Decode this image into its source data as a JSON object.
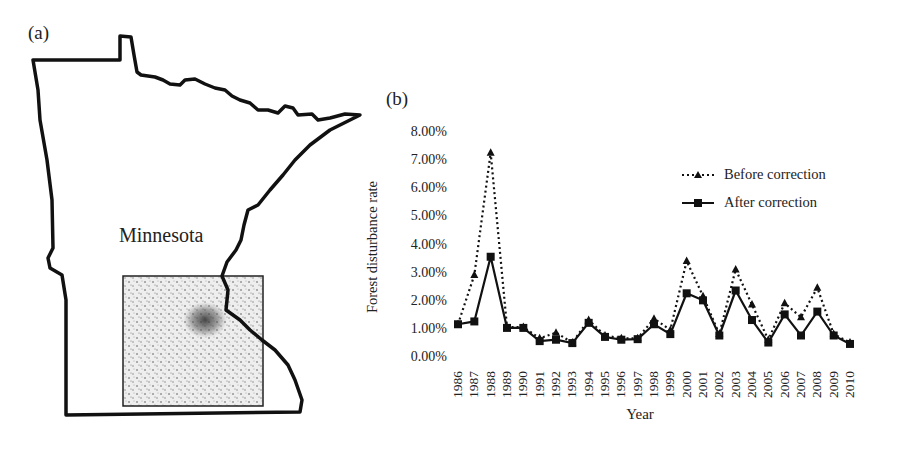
{
  "panels": {
    "a": {
      "label": "(a)",
      "state_name": "Minnesota"
    },
    "b": {
      "label": "(b)"
    }
  },
  "chart_data": {
    "type": "line",
    "title": "",
    "xlabel": "Year",
    "ylabel": "Forest disturbance rate",
    "ylim": [
      0,
      8
    ],
    "y_ticks": [
      "0.00%",
      "1.00%",
      "2.00%",
      "3.00%",
      "4.00%",
      "5.00%",
      "6.00%",
      "7.00%",
      "8.00%"
    ],
    "grid": false,
    "legend_position": "upper right",
    "categories": [
      "1986",
      "1987",
      "1988",
      "1989",
      "1990",
      "1991",
      "1992",
      "1993",
      "1994",
      "1995",
      "1996",
      "1997",
      "1998",
      "1999",
      "2000",
      "2001",
      "2002",
      "2003",
      "2004",
      "2005",
      "2006",
      "2007",
      "2008",
      "2009",
      "2010"
    ],
    "series": [
      {
        "name": "Before correction",
        "style": "dotted",
        "marker": "triangle",
        "values": [
          1.2,
          2.95,
          7.3,
          1.1,
          1.1,
          0.7,
          0.9,
          0.55,
          1.35,
          0.8,
          0.7,
          0.7,
          1.4,
          1.0,
          3.45,
          2.2,
          0.85,
          3.15,
          1.9,
          0.65,
          1.95,
          1.45,
          2.5,
          0.85,
          0.55
        ]
      },
      {
        "name": "After correction",
        "style": "solid",
        "marker": "square",
        "values": [
          1.2,
          1.3,
          3.6,
          1.07,
          1.07,
          0.6,
          0.65,
          0.53,
          1.25,
          0.75,
          0.65,
          0.67,
          1.2,
          0.85,
          2.3,
          2.05,
          0.8,
          2.4,
          1.35,
          0.55,
          1.55,
          0.8,
          1.65,
          0.8,
          0.5
        ]
      }
    ]
  }
}
